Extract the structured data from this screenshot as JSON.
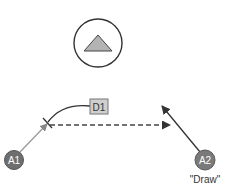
{
  "diagram": {
    "top_button": {
      "icon": "triangle-up-icon",
      "fill": "#b3b3b3",
      "stroke": "#333333"
    },
    "nodes": [
      {
        "id": "A1",
        "label": "A1",
        "fill": "#6e6e6e",
        "text_color": "#ffffff"
      },
      {
        "id": "A2",
        "label": "A2",
        "fill": "#7a7a7a",
        "text_color": "#ffffff",
        "caption": "\"Draw\""
      }
    ],
    "decision_box": {
      "label": "D1",
      "fill": "#cfcfcf",
      "stroke": "#777777"
    },
    "edges": [
      {
        "from": "A1",
        "to": "tick",
        "style": "solid",
        "color": "#999999"
      },
      {
        "from": "tick",
        "to": "right",
        "style": "dashed",
        "color": "#444444"
      },
      {
        "from": "A2",
        "to": "up-left",
        "style": "solid",
        "color": "#333333"
      },
      {
        "from": "tick",
        "to": "D1",
        "style": "curve",
        "color": "#333333"
      }
    ]
  }
}
